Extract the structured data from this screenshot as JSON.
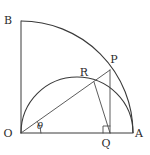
{
  "figure": {
    "background_color": "#ffffff",
    "stroke_color": "#3a3a3a",
    "label_color": "#2b2b2b",
    "width": 150,
    "height": 155,
    "labels": {
      "origin": "O",
      "point_a": "A",
      "point_b": "B",
      "point_p": "P",
      "point_q": "Q",
      "point_r": "R",
      "angle": "θ"
    }
  },
  "chart_data": {
    "type": "scatter",
    "xlabel": "",
    "ylabel": "",
    "grid": false,
    "legend": "none",
    "xlim": [
      0,
      150
    ],
    "ylim": [
      0,
      155
    ],
    "points": [
      {
        "name": "O",
        "label": "O",
        "x": 21,
        "y": 133,
        "label_x": 8,
        "label_y": 137
      },
      {
        "name": "A",
        "label": "A",
        "x": 133,
        "y": 133,
        "label_x": 135,
        "label_y": 137
      },
      {
        "name": "B",
        "label": "B",
        "x": 21,
        "y": 21,
        "label_x": 8,
        "label_y": 24
      },
      {
        "name": "P",
        "label": "P",
        "x": 110,
        "y": 70,
        "label_x": 114,
        "label_y": 63
      },
      {
        "name": "Q",
        "label": "Q",
        "x": 110,
        "y": 133,
        "label_x": 106,
        "label_y": 147
      },
      {
        "name": "R",
        "label": "R",
        "x": 94,
        "y": 82,
        "label_x": 84,
        "label_y": 76
      }
    ],
    "arcs": [
      {
        "name": "quarter-circle-arc",
        "center_x": 21,
        "center_y": 133,
        "radius": 112,
        "start_deg": 0,
        "end_deg": 90
      },
      {
        "name": "semicircle-arc",
        "center_x": 77,
        "center_y": 133,
        "radius": 56,
        "start_deg": 0,
        "end_deg": 180
      }
    ],
    "segments": [
      {
        "name": "OA",
        "x1": 21,
        "y1": 133,
        "x2": 133,
        "y2": 133
      },
      {
        "name": "OB",
        "x1": 21,
        "y1": 133,
        "x2": 21,
        "y2": 21
      },
      {
        "name": "OP",
        "x1": 21,
        "y1": 133,
        "x2": 110,
        "y2": 70
      },
      {
        "name": "PQ",
        "x1": 110,
        "y1": 70,
        "x2": 110,
        "y2": 133
      },
      {
        "name": "RQ",
        "x1": 94,
        "y1": 82,
        "x2": 110,
        "y2": 133
      }
    ],
    "angle_mark": {
      "name": "theta",
      "vertex_x": 21,
      "vertex_y": 133,
      "radius": 20,
      "from_deg": 0,
      "to_deg": 35,
      "label": "θ",
      "label_x": 40,
      "label_y": 129,
      "value_deg": 35
    },
    "right_angle_mark": {
      "name": "right-angle-at-Q",
      "x": 103,
      "y": 126,
      "size": 7
    }
  }
}
